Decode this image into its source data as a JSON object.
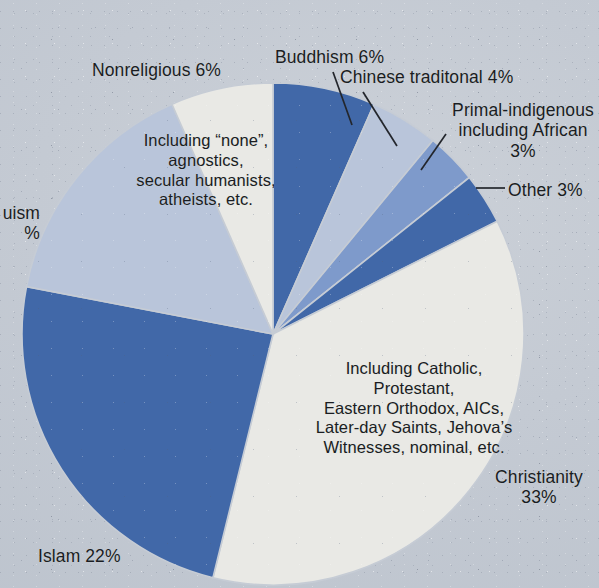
{
  "figure": {
    "kind": "pie-chart",
    "background_color": "#c4cad3",
    "label_color": "#1a1d22"
  },
  "chart_data": {
    "type": "pie",
    "title": "",
    "xlabel": "",
    "ylabel": "",
    "legend_position": "none",
    "grid": false,
    "units": "percent",
    "start_angle_deg": 0,
    "direction": "clockwise",
    "categories": [
      "Buddhism",
      "Chinese traditonal",
      "Primal-indigenous including African",
      "Other",
      "Christianity",
      "Islam",
      "Hinduism",
      "Nonreligious"
    ],
    "values": [
      6,
      4,
      3,
      3,
      33,
      22,
      14,
      6
    ],
    "labels": [
      "Buddhism 6%",
      "Chinese traditonal 4%",
      "Primal-indigenous\nincluding African\n3%",
      "Other 3%",
      "Christianity\n33%",
      "Islam 22%",
      "Hinduism\n14%",
      "Nonreligious 6%"
    ],
    "colors": [
      "#4269a8",
      "#b9c5da",
      "#7e9acb",
      "#4269a8",
      "#e9e9e5",
      "#4269a8",
      "#b9c5da",
      "#e9e9e5"
    ],
    "annotations": [
      "Including “none”,\nagnostics,\nsecular humanists,\natheists, etc.",
      "Including Catholic, Protestant,\nEastern Orthodox, AICs,\nLater-day Saints, Jehova’s\nWitnesses, nominal, etc."
    ]
  },
  "labels": {
    "nonreligious": "Nonreligious 6%",
    "nonreligious_sub": "Including “none”,\nagnostics,\nsecular humanists,\natheists, etc.",
    "buddhism": "Buddhism 6%",
    "chinese": "Chinese traditonal 4%",
    "primal": "Primal-indigenous\nincluding African\n3%",
    "other": "Other 3%",
    "christianity": "Christianity\n33%",
    "christianity_sub": "Including Catholic, Protestant,\nEastern Orthodox, AICs,\nLater-day Saints, Jehova’s\nWitnesses, nominal, etc.",
    "islam": "Islam 22%",
    "hinduism": "uism\n%"
  }
}
